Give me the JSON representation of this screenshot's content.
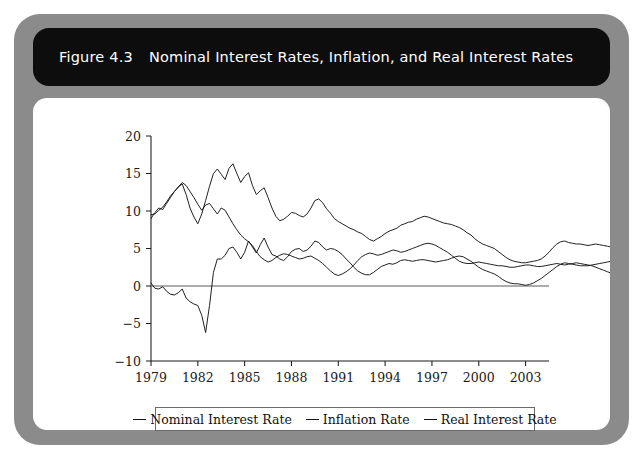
{
  "figure": {
    "label": "Figure 4.3",
    "title": "Nominal Interest Rates, Inflation, and Real Interest Rates",
    "frame_color": "#8b8b8b",
    "title_bar_color": "#0d0d0d",
    "panel_color": "#ffffff"
  },
  "legend": {
    "position": "bottom-center",
    "entries": [
      {
        "label": "Nominal Interest Rate",
        "color": "#151515"
      },
      {
        "label": "Inflation Rate",
        "color": "#151515"
      },
      {
        "label": "Real Interest Rate",
        "color": "#151515"
      }
    ]
  },
  "chart_data": {
    "type": "line",
    "title": "Nominal Interest Rates, Inflation, and Real Interest Rates",
    "xlabel": "",
    "ylabel": "",
    "xlim": [
      1979,
      2004.5
    ],
    "ylim": [
      -10,
      20
    ],
    "xticks": [
      1979,
      1982,
      1985,
      1988,
      1991,
      1994,
      1997,
      2000,
      2003
    ],
    "xticklabels": [
      "1979",
      "1982",
      "1985",
      "1988",
      "1991",
      "1994",
      "1997",
      "2000",
      "2003"
    ],
    "yticks": [
      -10,
      -5,
      0,
      5,
      10,
      15,
      20
    ],
    "yticklabels": [
      "-10",
      "-5",
      "0",
      "5",
      "10",
      "15",
      "20"
    ],
    "grid": false,
    "zero_line": true,
    "x_start": 1979.0,
    "x_step": 0.25,
    "series": [
      {
        "name": "Nominal Interest Rate",
        "color": "#151515",
        "values": [
          9.5,
          9.6,
          10.1,
          10.5,
          11.2,
          12.0,
          12.6,
          13.2,
          13.6,
          12.2,
          10.4,
          9.2,
          8.3,
          9.6,
          11.4,
          13.3,
          15.0,
          15.6,
          14.9,
          14.2,
          15.7,
          16.3,
          15.0,
          13.8,
          14.6,
          15.1,
          13.4,
          12.2,
          12.7,
          13.1,
          11.8,
          10.4,
          9.3,
          8.7,
          8.9,
          9.3,
          9.8,
          9.7,
          9.4,
          9.2,
          9.6,
          10.4,
          11.4,
          11.6,
          11.1,
          10.3,
          9.7,
          9.0,
          8.6,
          8.3,
          8.0,
          7.7,
          7.5,
          7.2,
          7.0,
          6.6,
          6.2,
          6.0,
          6.3,
          6.6,
          7.0,
          7.3,
          7.5,
          7.7,
          8.1,
          8.3,
          8.5,
          8.6,
          8.9,
          9.1,
          9.3,
          9.2,
          9.0,
          8.8,
          8.6,
          8.4,
          8.3,
          8.2,
          8.0,
          7.8,
          7.5,
          7.1,
          6.8,
          6.3,
          5.9,
          5.6,
          5.4,
          5.2,
          5.0,
          4.6,
          4.2,
          3.8,
          3.5,
          3.3,
          3.2,
          3.1,
          3.1,
          3.2,
          3.3,
          3.4,
          3.6,
          4.0,
          4.5,
          5.1,
          5.6,
          5.9,
          6.0,
          5.8,
          5.7,
          5.6,
          5.6,
          5.5,
          5.4,
          5.5,
          5.6,
          5.5,
          5.4,
          5.3,
          5.2,
          5.2,
          5.3,
          5.4,
          5.5,
          5.6,
          5.5,
          5.4,
          5.3,
          5.2,
          5.1,
          5.0,
          4.9,
          4.8,
          4.8,
          5.0,
          5.3,
          5.6,
          5.9,
          6.1,
          6.3,
          6.4,
          6.5,
          6.4,
          6.2,
          6.0,
          5.4,
          4.4,
          3.5,
          2.3,
          1.9,
          1.8,
          1.7,
          1.5,
          1.4,
          1.3,
          1.2,
          1.1,
          1.0,
          1.0,
          1.1,
          1.2,
          1.3,
          1.4,
          1.5,
          1.6
        ]
      },
      {
        "name": "Inflation Rate",
        "color": "#151515",
        "values": [
          9.0,
          9.8,
          10.4,
          10.2,
          11.0,
          11.8,
          12.6,
          13.2,
          13.8,
          13.4,
          12.6,
          11.8,
          10.9,
          10.1,
          10.8,
          11.0,
          10.3,
          9.6,
          10.4,
          10.1,
          9.2,
          8.3,
          7.5,
          6.8,
          6.3,
          5.9,
          5.4,
          4.6,
          3.9,
          3.5,
          3.2,
          3.4,
          3.8,
          4.1,
          4.3,
          4.2,
          4.0,
          3.8,
          3.6,
          3.7,
          3.9,
          4.0,
          3.7,
          3.4,
          3.0,
          2.5,
          2.0,
          1.6,
          1.4,
          1.6,
          1.9,
          2.3,
          2.8,
          3.4,
          3.9,
          4.2,
          4.4,
          4.3,
          4.1,
          4.2,
          4.4,
          4.6,
          4.8,
          4.7,
          4.5,
          4.6,
          4.8,
          5.0,
          5.2,
          5.4,
          5.6,
          5.7,
          5.6,
          5.4,
          5.1,
          4.8,
          4.5,
          4.1,
          3.7,
          3.3,
          3.1,
          3.0,
          3.0,
          3.1,
          3.2,
          3.1,
          3.0,
          2.9,
          2.8,
          2.7,
          2.7,
          2.6,
          2.5,
          2.5,
          2.6,
          2.7,
          2.8,
          2.8,
          2.7,
          2.6,
          2.6,
          2.7,
          2.8,
          2.9,
          3.0,
          2.9,
          2.8,
          2.9,
          3.0,
          3.1,
          3.0,
          2.9,
          2.8,
          2.7,
          2.5,
          2.3,
          2.1,
          1.9,
          1.7,
          1.6,
          1.6,
          1.7,
          1.9,
          2.2,
          2.4,
          2.5,
          2.4,
          2.3,
          2.2,
          2.3,
          2.5,
          2.8,
          3.1,
          3.3,
          3.5,
          3.4,
          3.3,
          3.4,
          3.5,
          3.4,
          3.2,
          3.0,
          2.8,
          2.6,
          2.4,
          2.2,
          1.9,
          1.6,
          1.4,
          1.3,
          1.4,
          1.6,
          1.8,
          2.0,
          2.2,
          2.3,
          2.2,
          2.1,
          2.0,
          2.0,
          2.1,
          2.6,
          3.0,
          3.2
        ]
      },
      {
        "name": "Real Interest Rate",
        "color": "#151515",
        "values": [
          0.4,
          -0.3,
          -0.4,
          -0.1,
          -0.7,
          -1.1,
          -1.2,
          -0.9,
          -0.4,
          -1.6,
          -2.1,
          -2.4,
          -2.6,
          -3.9,
          -6.2,
          -2.6,
          1.8,
          3.6,
          3.6,
          4.1,
          5.0,
          5.2,
          4.5,
          3.6,
          4.5,
          6.0,
          5.2,
          4.4,
          5.5,
          6.4,
          5.2,
          4.2,
          4.0,
          3.6,
          3.4,
          3.9,
          4.6,
          4.9,
          5.0,
          4.6,
          4.8,
          5.3,
          6.0,
          5.8,
          5.2,
          4.8,
          5.0,
          4.9,
          4.6,
          4.2,
          3.6,
          3.1,
          2.5,
          2.0,
          1.7,
          1.5,
          1.5,
          1.8,
          2.2,
          2.6,
          2.8,
          3.0,
          2.9,
          3.1,
          3.4,
          3.5,
          3.4,
          3.3,
          3.4,
          3.5,
          3.5,
          3.4,
          3.3,
          3.2,
          3.3,
          3.4,
          3.5,
          3.7,
          3.9,
          4.0,
          3.9,
          3.6,
          3.3,
          2.9,
          2.5,
          2.2,
          2.0,
          1.8,
          1.6,
          1.3,
          0.9,
          0.6,
          0.4,
          0.3,
          0.3,
          0.2,
          0.1,
          0.2,
          0.4,
          0.7,
          1.0,
          1.4,
          1.8,
          2.2,
          2.6,
          2.9,
          3.1,
          3.0,
          2.9,
          2.8,
          2.7,
          2.7,
          2.7,
          2.8,
          2.9,
          3.0,
          3.1,
          3.2,
          3.3,
          3.4,
          3.5,
          3.5,
          3.4,
          3.2,
          3.0,
          2.8,
          2.7,
          2.8,
          3.0,
          3.1,
          3.2,
          3.1,
          2.9,
          2.8,
          2.9,
          3.1,
          3.3,
          3.4,
          3.3,
          3.2,
          3.3,
          3.4,
          3.4,
          3.3,
          2.8,
          1.9,
          1.0,
          0.2,
          -0.3,
          -0.8,
          -1.0,
          -1.3,
          -1.5,
          -1.4,
          -1.2,
          -1.1,
          -1.2,
          -1.3,
          -1.4,
          -1.3,
          -1.2,
          -1.4,
          -1.7,
          -1.6
        ]
      }
    ]
  }
}
